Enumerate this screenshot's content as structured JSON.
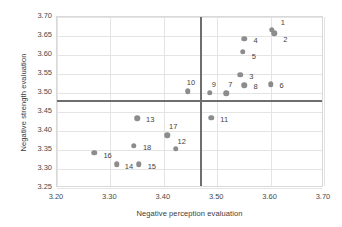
{
  "chart_data": {
    "type": "scatter",
    "title": "",
    "xlabel": "Negative perception evaluation",
    "ylabel": "Negative strength evaluation",
    "xlim": [
      3.2,
      3.7
    ],
    "ylim": [
      3.25,
      3.7
    ],
    "xticks": [
      "3.20",
      "3.30",
      "3.40",
      "3.50",
      "3.60",
      "3.70"
    ],
    "xtick_values": [
      3.2,
      3.3,
      3.4,
      3.5,
      3.6,
      3.7
    ],
    "yticks": [
      "3.25",
      "3.30",
      "3.35",
      "3.40",
      "3.45",
      "3.50",
      "3.55",
      "3.60",
      "3.65",
      "3.70"
    ],
    "ytick_values": [
      3.25,
      3.3,
      3.35,
      3.4,
      3.45,
      3.5,
      3.55,
      3.6,
      3.65,
      3.7
    ],
    "grid": true,
    "legend": "none",
    "reference_lines": {
      "vertical_x": 3.47,
      "horizontal_y": 3.478
    },
    "points": [
      {
        "label": "1",
        "x": 3.602,
        "y": 3.667,
        "label_dx": 9,
        "label_dy": -8
      },
      {
        "label": "2",
        "x": 3.607,
        "y": 3.657,
        "label_dx": 9,
        "label_dy": 6
      },
      {
        "label": "4",
        "x": 3.551,
        "y": 3.643,
        "label_dx": 9,
        "label_dy": 1
      },
      {
        "label": "5",
        "x": 3.548,
        "y": 3.608,
        "label_dx": 9,
        "label_dy": 4
      },
      {
        "label": "3",
        "x": 3.543,
        "y": 3.548,
        "label_dx": 9,
        "label_dy": 1
      },
      {
        "label": "6",
        "x": 3.6,
        "y": 3.523,
        "label_dx": 9,
        "label_dy": 1
      },
      {
        "label": "8",
        "x": 3.551,
        "y": 3.521,
        "label_dx": 9,
        "label_dy": 1
      },
      {
        "label": "7",
        "x": 3.517,
        "y": 3.5,
        "label_dx": 2,
        "label_dy": -9
      },
      {
        "label": "9",
        "x": 3.486,
        "y": 3.501,
        "label_dx": 2,
        "label_dy": -9
      },
      {
        "label": "10",
        "x": 3.445,
        "y": 3.505,
        "label_dx": -1,
        "label_dy": -9
      },
      {
        "label": "11",
        "x": 3.489,
        "y": 3.435,
        "label_dx": 9,
        "label_dy": 1
      },
      {
        "label": "13",
        "x": 3.35,
        "y": 3.434,
        "label_dx": 9,
        "label_dy": 1
      },
      {
        "label": "17",
        "x": 3.406,
        "y": 3.389,
        "label_dx": 2,
        "label_dy": -9
      },
      {
        "label": "18",
        "x": 3.344,
        "y": 3.361,
        "label_dx": 9,
        "label_dy": 1
      },
      {
        "label": "12",
        "x": 3.422,
        "y": 3.353,
        "label_dx": 2,
        "label_dy": -8
      },
      {
        "label": "16",
        "x": 3.27,
        "y": 3.343,
        "label_dx": 9,
        "label_dy": 2
      },
      {
        "label": "14",
        "x": 3.312,
        "y": 3.313,
        "label_dx": 8,
        "label_dy": 2
      },
      {
        "label": "15",
        "x": 3.353,
        "y": 3.313,
        "label_dx": 9,
        "label_dy": 2
      }
    ],
    "marker_color": "#8c8c8c",
    "gridline_color": "#e4e4e4",
    "refline_color": "#6e6e6e"
  }
}
